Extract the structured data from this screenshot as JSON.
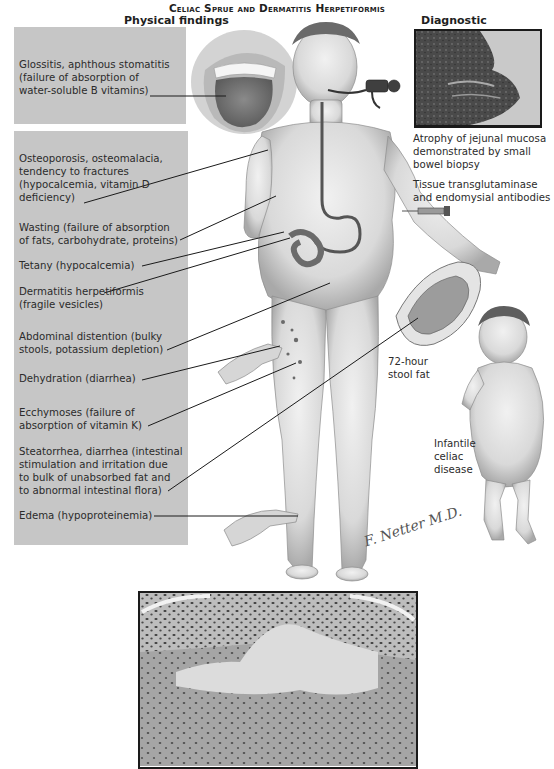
{
  "title": "Celiac Sprue and Dermatitis Herpetiformis",
  "sections": {
    "left_heading": "Physical findings",
    "right_heading": "Diagnostic evaluation"
  },
  "physical_findings": [
    {
      "lines": [
        "Glossitis, aphthous stomatitis",
        "(failure of absorption of",
        "water-soluble B vitamins)"
      ]
    },
    {
      "lines": [
        "Osteoporosis, osteomalacia,",
        "tendency to fractures",
        "(hypocalcemia, vitamin D",
        "deficiency)"
      ]
    },
    {
      "lines": [
        "Wasting (failure of absorption",
        "of fats, carbohydrate, proteins)"
      ]
    },
    {
      "lines": [
        "Tetany (hypocalcemia)"
      ]
    },
    {
      "lines": [
        "Dermatitis herpetiformis",
        "(fragile vesicles)"
      ]
    },
    {
      "lines": [
        "Abdominal distention (bulky",
        "stools, potassium depletion)"
      ]
    },
    {
      "lines": [
        "Dehydration (diarrhea)"
      ]
    },
    {
      "lines": [
        "Ecchymoses (failure of",
        "absorption of vitamin K)"
      ]
    },
    {
      "lines": [
        "Steatorrhea, diarrhea (intestinal",
        "stimulation and irritation due",
        "to bulk of unabsorbed fat and",
        "to abnormal intestinal flora)"
      ]
    },
    {
      "lines": [
        "Edema (hypoproteinemia)"
      ]
    }
  ],
  "diagnostic_evaluation": {
    "biopsy_caption": [
      "Atrophy of jejunal mucosa",
      "demonstrated by small",
      "bowel biopsy"
    ],
    "antibodies_caption": [
      "Tissue transglutaminase",
      "and endomysial antibodies"
    ],
    "stool_caption": [
      "72-hour",
      "stool fat"
    ],
    "infant_caption": [
      "Infantile",
      "celiac",
      "disease"
    ]
  },
  "signature": "F. Netter M.D.",
  "colors": {
    "label_box": "#c6c6c6",
    "text": "#2b2b2b",
    "leader_line": "#1a1a1a",
    "frame": "#1a1a1a"
  }
}
